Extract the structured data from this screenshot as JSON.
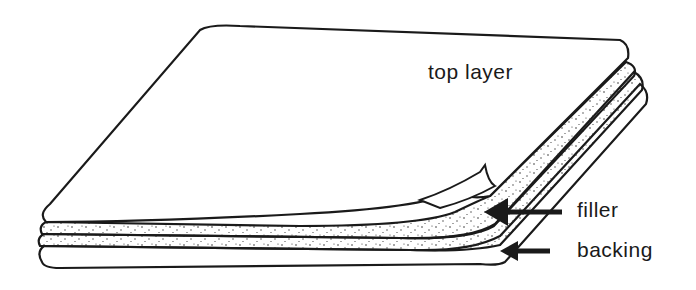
{
  "diagram": {
    "labels": {
      "top_layer": "top layer",
      "filler": "filler",
      "backing": "backing"
    },
    "colors": {
      "line": "#1a1a1a",
      "background": "#ffffff"
    }
  }
}
